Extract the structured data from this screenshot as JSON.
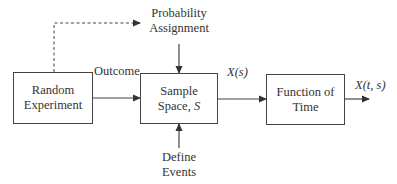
{
  "diagram": {
    "blocks": [
      {
        "id": "random_experiment",
        "line1": "Random",
        "line2": "Experiment"
      },
      {
        "id": "sample_space",
        "line1": "Sample",
        "line2_text": "Space, ",
        "line2_var": "S"
      },
      {
        "id": "function_of_time",
        "line1": "Function of",
        "line2": "Time"
      }
    ],
    "inputs": {
      "probability": {
        "line1": "Probability",
        "line2": "Assignment"
      },
      "events": {
        "line1": "Define",
        "line2": "Events"
      }
    },
    "edge_labels": {
      "outcome": "Outcome",
      "xs": "X(s)",
      "xts": "X(t, s)"
    },
    "colors": {
      "line": "#444444",
      "text": "#333333",
      "background": "#ffffff"
    }
  }
}
